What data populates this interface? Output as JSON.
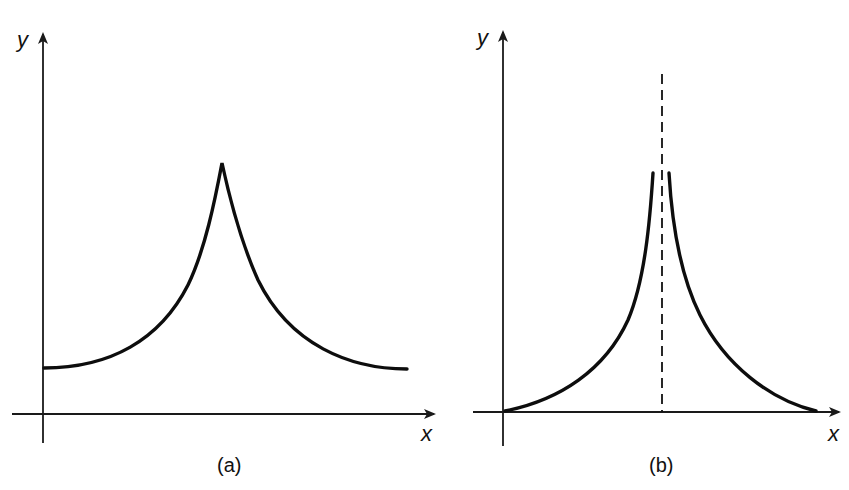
{
  "figure": {
    "panels": [
      {
        "id": "a",
        "caption": "(a)",
        "x_axis_label": "x",
        "y_axis_label": "y",
        "description": "Symmetric cusp-shaped curve: starts at a finite positive level at the y-axis, rises to a sharp finite peak in the middle, then falls symmetrically to the same level."
      },
      {
        "id": "b",
        "caption": "(b)",
        "x_axis_label": "x",
        "y_axis_label": "y",
        "description": "Symmetric curve starting at zero, rising toward a vertical dashed asymptote in the middle (curve diverges / broken near the center), then decaying symmetrically back to zero.",
        "asymptote": "vertical dashed line at center"
      }
    ],
    "colors": {
      "line": "#0d0d0d",
      "background": "#ffffff"
    }
  }
}
